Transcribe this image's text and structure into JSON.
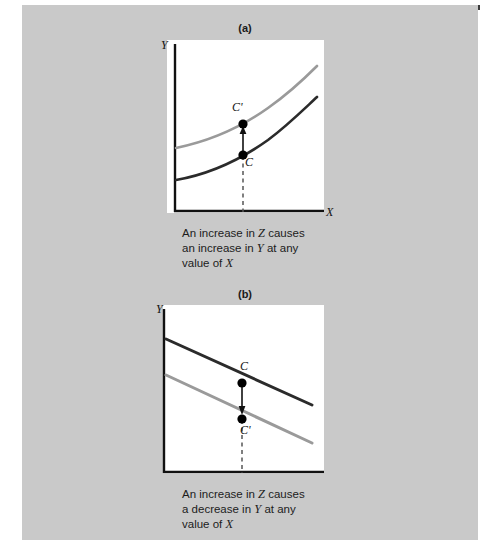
{
  "figure": {
    "background_color": "#c9c9c9",
    "page_color": "#ffffff",
    "top_rule_color": "#3a3a3a"
  },
  "panels": [
    {
      "id": "a",
      "title": "(a)",
      "y_axis_label": "Y",
      "x_axis_label": "X",
      "caption_lines": [
        "An increase in Z causes",
        "an increase in Y at any",
        "value of X"
      ],
      "caption_full": "An increase in Z causes an increase in Y at any value of X",
      "points": [
        {
          "label": "C'",
          "x": 243,
          "y": 124
        },
        {
          "label": "C",
          "x": 243,
          "y": 155
        }
      ],
      "arrow_direction": "up",
      "curve_shape": "convex-increasing",
      "curves": [
        {
          "name": "shifted-curve",
          "color": "#9a9a9a",
          "position": "upper"
        },
        {
          "name": "original-curve",
          "color": "#2b2b2b",
          "position": "lower"
        }
      ]
    },
    {
      "id": "b",
      "title": "(b)",
      "y_axis_label": "Y",
      "x_axis_label": "X",
      "caption_lines": [
        "An increase in Z causes",
        "a decrease in Y at any",
        "value of X"
      ],
      "caption_full": "An increase in Z causes a decrease in Y at any value of X",
      "points": [
        {
          "label": "C",
          "x": 242,
          "y": 383
        },
        {
          "label": "C'",
          "x": 242,
          "y": 419
        }
      ],
      "arrow_direction": "down",
      "curve_shape": "linear-decreasing",
      "curves": [
        {
          "name": "original-line",
          "color": "#2b2b2b",
          "position": "upper"
        },
        {
          "name": "shifted-line",
          "color": "#9a9a9a",
          "position": "lower"
        }
      ]
    }
  ],
  "colors": {
    "dark_curve": "#2b2b2b",
    "light_curve": "#9a9a9a",
    "axis": "#111111",
    "dashed_guide": "#555555",
    "marker": "#000000"
  }
}
